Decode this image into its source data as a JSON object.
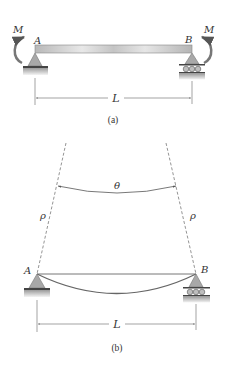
{
  "figure_a": {
    "caption": "(a)",
    "left_support_label": "A",
    "right_support_label": "B",
    "left_moment_label": "M",
    "right_moment_label": "M",
    "span_label": "L"
  },
  "figure_b": {
    "caption": "(b)",
    "left_support_label": "A",
    "right_support_label": "B",
    "angle_label": "θ",
    "left_radius_label": "ρ",
    "right_radius_label": "ρ",
    "span_label": "L"
  },
  "colors": {
    "beam_fill": "#c8c8c8",
    "support_fill": "#a8a8a8",
    "line": "#555555",
    "text": "#333333"
  }
}
